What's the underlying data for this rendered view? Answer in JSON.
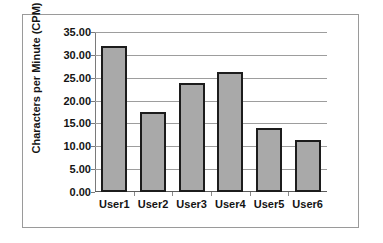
{
  "chart_data": {
    "type": "bar",
    "title": "",
    "xlabel": "",
    "ylabel": "Characters per Minute (CPM)",
    "categories": [
      "User1",
      "User2",
      "User3",
      "User4",
      "User5",
      "User6"
    ],
    "values": [
      32.0,
      17.6,
      23.8,
      26.3,
      14.0,
      11.4
    ],
    "ylim": [
      0.0,
      35.0
    ],
    "ytick_step": 5.0,
    "ytick_labels": [
      "0.00",
      "5.00",
      "10.00",
      "15.00",
      "20.00",
      "25.00",
      "30.00",
      "35.00"
    ],
    "ytick_values": [
      0,
      5,
      10,
      15,
      20,
      25,
      30,
      35
    ],
    "grid": "horizontal",
    "legend": "none",
    "bar_fill_color": "#a9a9a9",
    "bar_border_color": "#1c1c1c",
    "gridline_color": "#9d9d9d",
    "axis_color": "#5a5a5a",
    "frame_color": "#9a9a9a",
    "background_color": "#ffffff",
    "text_color": "#141414"
  }
}
